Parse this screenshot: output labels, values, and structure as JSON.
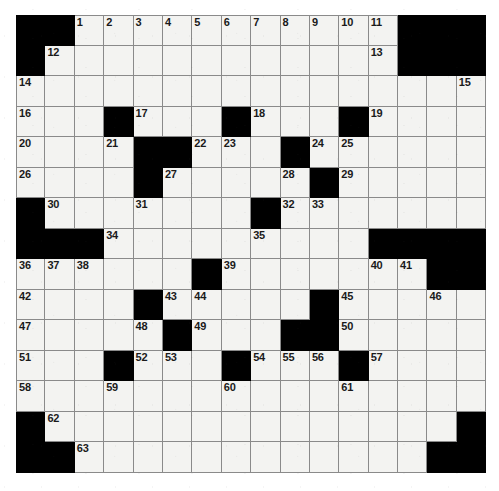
{
  "puzzle": {
    "kind": "crossword-grid",
    "columns": 16,
    "rows": 15,
    "cell_size_px": 29.4,
    "colors": {
      "block": "#000000",
      "open": "#f3f3f1",
      "gridline": "#8a8a8a",
      "number": "#1a1a1a",
      "page": "#ffffff"
    },
    "max_clue_number": 63,
    "grid": [
      [
        {
          "b": true
        },
        {
          "b": true
        },
        {
          "n": "1"
        },
        {
          "n": "2"
        },
        {
          "n": "3"
        },
        {
          "n": "4"
        },
        {
          "n": "5"
        },
        {
          "n": "6"
        },
        {
          "n": "7"
        },
        {
          "n": "8"
        },
        {
          "n": "9"
        },
        {
          "n": "10"
        },
        {
          "n": "11"
        },
        {
          "b": true
        },
        {
          "b": true
        },
        {
          "b": true
        }
      ],
      [
        {
          "b": true
        },
        {
          "n": "12"
        },
        {},
        {},
        {},
        {},
        {},
        {},
        {},
        {},
        {},
        {},
        {
          "n": "13"
        },
        {
          "b": true
        },
        {
          "b": true
        },
        {
          "b": true
        }
      ],
      [
        {
          "n": "14"
        },
        {},
        {},
        {},
        {},
        {},
        {},
        {},
        {},
        {},
        {},
        {},
        {},
        {},
        {},
        {
          "n": "15"
        }
      ],
      [
        {
          "n": "16"
        },
        {},
        {},
        {
          "b": true
        },
        {
          "n": "17"
        },
        {},
        {},
        {
          "b": true
        },
        {
          "n": "18"
        },
        {},
        {},
        {
          "b": true
        },
        {
          "n": "19"
        },
        {},
        {},
        {}
      ],
      [
        {
          "n": "20"
        },
        {},
        {},
        {
          "n": "21"
        },
        {
          "b": true
        },
        {
          "b": true
        },
        {
          "n": "22"
        },
        {
          "n": "23"
        },
        {},
        {
          "b": true
        },
        {
          "n": "24"
        },
        {
          "n": "25"
        },
        {},
        {},
        {},
        {}
      ],
      [
        {
          "n": "26"
        },
        {},
        {},
        {},
        {
          "b": true
        },
        {
          "n": "27"
        },
        {},
        {},
        {},
        {
          "n": "28"
        },
        {
          "b": true
        },
        {
          "n": "29"
        },
        {},
        {},
        {},
        {}
      ],
      [
        {
          "b": true
        },
        {
          "n": "30"
        },
        {},
        {},
        {
          "n": "31"
        },
        {},
        {},
        {},
        {
          "b": true
        },
        {
          "n": "32"
        },
        {
          "n": "33"
        },
        {},
        {},
        {},
        {},
        {}
      ],
      [
        {
          "b": true
        },
        {
          "b": true
        },
        {
          "b": true
        },
        {
          "n": "34"
        },
        {},
        {},
        {},
        {},
        {
          "n": "35"
        },
        {},
        {},
        {},
        {
          "b": true
        },
        {
          "b": true
        },
        {
          "b": true
        },
        {
          "b": true
        }
      ],
      [
        {
          "n": "36"
        },
        {
          "n": "37"
        },
        {
          "n": "38"
        },
        {},
        {},
        {},
        {
          "b": true
        },
        {
          "n": "39"
        },
        {},
        {},
        {},
        {},
        {
          "n": "40"
        },
        {
          "n": "41"
        },
        {
          "b": true
        },
        {
          "b": true
        }
      ],
      [
        {
          "n": "42"
        },
        {},
        {},
        {},
        {
          "b": true
        },
        {
          "n": "43"
        },
        {
          "n": "44"
        },
        {},
        {},
        {},
        {
          "b": true
        },
        {
          "n": "45"
        },
        {},
        {},
        {
          "n": "46"
        },
        {}
      ],
      [
        {
          "n": "47"
        },
        {},
        {},
        {},
        {
          "n": "48"
        },
        {
          "b": true
        },
        {
          "n": "49"
        },
        {},
        {},
        {
          "b": true
        },
        {
          "b": true
        },
        {
          "n": "50"
        },
        {},
        {},
        {},
        {}
      ],
      [
        {
          "n": "51"
        },
        {},
        {},
        {
          "b": true
        },
        {
          "n": "52"
        },
        {
          "n": "53"
        },
        {},
        {
          "b": true
        },
        {
          "n": "54"
        },
        {
          "n": "55"
        },
        {
          "n": "56"
        },
        {
          "b": true
        },
        {
          "n": "57"
        },
        {},
        {},
        {}
      ],
      [
        {
          "n": "58"
        },
        {},
        {},
        {
          "n": "59"
        },
        {},
        {},
        {},
        {
          "n": "60"
        },
        {},
        {},
        {},
        {
          "n": "61"
        },
        {},
        {},
        {},
        {}
      ],
      [
        {
          "b": true
        },
        {
          "n": "62"
        },
        {},
        {},
        {},
        {},
        {},
        {},
        {},
        {},
        {},
        {},
        {},
        {},
        {},
        {
          "b": true
        }
      ],
      [
        {
          "b": true
        },
        {
          "b": true
        },
        {
          "n": "63"
        },
        {},
        {},
        {},
        {},
        {},
        {},
        {},
        {},
        {},
        {},
        {},
        {
          "b": true
        },
        {
          "b": true
        }
      ]
    ]
  }
}
